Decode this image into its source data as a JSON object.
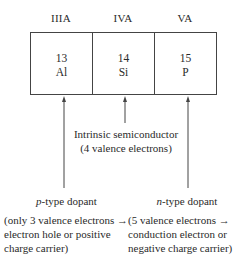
{
  "groups": [
    {
      "label": "IIIA",
      "number": "13",
      "symbol": "Al"
    },
    {
      "label": "IVA",
      "number": "14",
      "symbol": "Si"
    },
    {
      "label": "VA",
      "number": "15",
      "symbol": "P"
    }
  ],
  "intrinsic": {
    "line1": "Intrinsic semiconductor",
    "line2": "(4 valence electrons)"
  },
  "p_type": {
    "italic_prefix": "p",
    "title_rest": "-type dopant",
    "line1": "(only 3 valence electrons →",
    "line2": "electron hole or positive",
    "line3": "charge carrier)"
  },
  "n_type": {
    "italic_prefix": "n",
    "title_rest": "-type dopant",
    "line1": "(5 valence electrons →",
    "line2": "conduction electron or",
    "line3": "negative charge carrier)"
  },
  "colors": {
    "line": "#444444",
    "text": "#2a2a2a"
  }
}
